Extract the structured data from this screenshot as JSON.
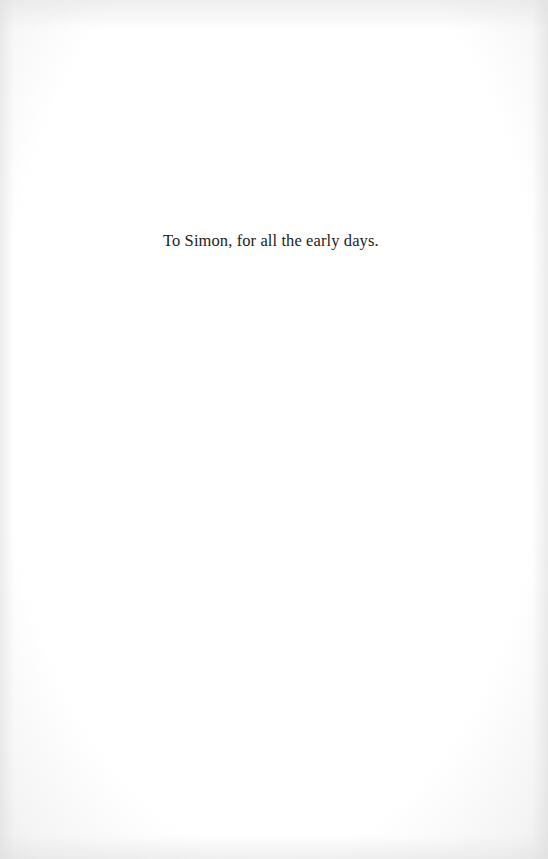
{
  "page": {
    "dedication": "To Simon, for all the early days."
  },
  "colors": {
    "background": "#ffffff",
    "text": "#222222"
  }
}
